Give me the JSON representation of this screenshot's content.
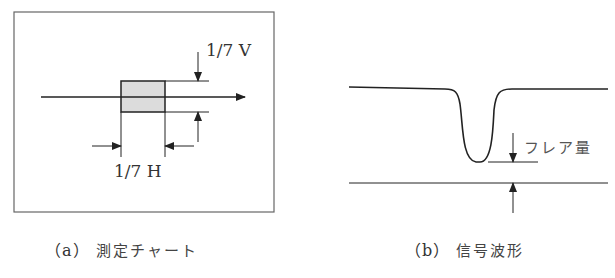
{
  "panel_a": {
    "label_v": "1/7 V",
    "label_h": "1/7 H",
    "caption_letter": "（a）",
    "caption_text": "測定チャート",
    "colors": {
      "frame": "#555555",
      "box_fill": "#dcdcdc",
      "line": "#222222"
    }
  },
  "panel_b": {
    "label_flare": "フレア量",
    "caption_letter": "（b）",
    "caption_text": "信号波形",
    "colors": {
      "line": "#222222"
    }
  }
}
